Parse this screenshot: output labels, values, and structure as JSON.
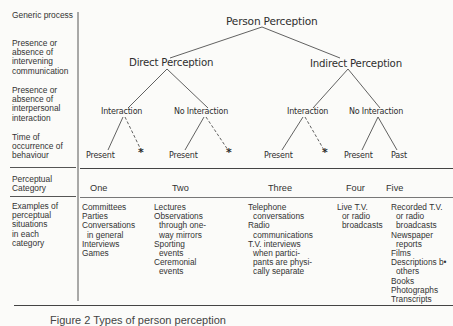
{
  "row_labels": {
    "generic": "Generic process",
    "communication": [
      "Presence or",
      "absence of",
      "intervening",
      "communication"
    ],
    "interpersonal": [
      "Presence or",
      "absence of",
      "interpersonal",
      "interaction"
    ],
    "time": [
      "Time of",
      "occurrence of",
      "behaviour"
    ],
    "category": [
      "Perceptual",
      "Category"
    ],
    "examples": [
      "Examples of",
      "perceptual",
      "situations",
      "in each",
      "category"
    ]
  },
  "tree": {
    "root": "Person  Perception",
    "direct": "Direct  Perception",
    "indirect": "Indirect  Perception",
    "direct_interaction": "Interaction",
    "direct_no_interaction": "No  Interaction",
    "indirect_interaction": "Interaction",
    "indirect_no_interaction": "No  Interaction",
    "leaves": {
      "d_int_present": "Present",
      "d_noint_present": "Present",
      "i_int_present": "Present",
      "i_noint_present": "Present",
      "i_noint_past": "Past",
      "star": "*"
    }
  },
  "categories": [
    "One",
    "Two",
    "Three",
    "Four",
    "Five"
  ],
  "examples": {
    "one": [
      "Committees",
      "Parties",
      "Conversations",
      " in general",
      "Interviews",
      "Games"
    ],
    "two": [
      "Lectures",
      "Observations",
      " through one-",
      " way mirrors",
      "Sporting",
      " events",
      "Ceremonial",
      " events"
    ],
    "three": [
      "Telephone",
      " conversations",
      "Radio",
      " communications",
      "T.V. interviews",
      " when partici-",
      " pants are physi-",
      " cally separate"
    ],
    "four": [
      "Live T.V.",
      " or radio",
      " broadcasts"
    ],
    "five": [
      "Recorded T.V.",
      " or radio",
      " broadcasts",
      "Newspaper",
      " reports",
      "Films",
      "Descriptions b•",
      " others",
      "Books",
      "Photographs",
      "Transcripts"
    ]
  },
  "caption": "Figure 2   Types of person perception"
}
